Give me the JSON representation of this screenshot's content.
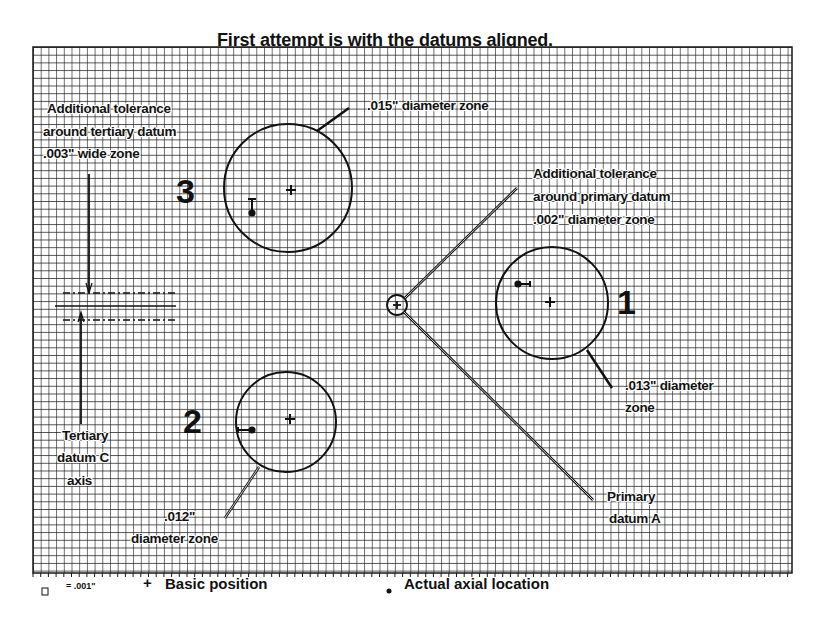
{
  "title": "First attempt is with the datums aligned.",
  "colors": {
    "ink": "#111111",
    "grid": "#1a1a1a",
    "paper": "#ffffff"
  },
  "grid": {
    "left": 33,
    "top": 47,
    "right": 792,
    "bottom": 573,
    "cell": 7.7
  },
  "features": [
    {
      "id": "3",
      "number_label": "3",
      "zone_label": ".015\" diameter zone",
      "center": [
        288,
        188
      ],
      "radius": 64,
      "basic_position": [
        291,
        190
      ],
      "actual_location": [
        252,
        213
      ]
    },
    {
      "id": "1",
      "number_label": "1",
      "zone_label_line1": ".013\" diameter",
      "zone_label_line2": "zone",
      "center": [
        552,
        303
      ],
      "radius": 56,
      "basic_position": [
        550,
        302
      ],
      "actual_location": [
        518,
        284
      ]
    },
    {
      "id": "2",
      "number_label": "2",
      "zone_label_line1": ".012\"",
      "zone_label_line2": "diameter zone",
      "center": [
        286,
        422
      ],
      "radius": 50,
      "basic_position": [
        290,
        419
      ],
      "actual_location": [
        252,
        430
      ]
    }
  ],
  "annotations": {
    "tertiary_tolerance": {
      "line1": "Additional tolerance",
      "line2": "around tertiary datum",
      "line3": ".003\" wide zone"
    },
    "primary_tolerance": {
      "line1": "Additional tolerance",
      "line2": "around primary datum",
      "line3": ".002\" diameter zone"
    },
    "tertiary_datum": {
      "line1": "Tertiary",
      "line2": "datum C",
      "line3": "axis"
    },
    "primary_datum": {
      "line1": "Primary",
      "line2": "datum A"
    }
  },
  "legend": {
    "grid_square_value": "= .001\"",
    "basic_position_symbol": "+",
    "basic_position_label": "Basic position",
    "actual_location_symbol": "•",
    "actual_location_label": "Actual axial location"
  }
}
